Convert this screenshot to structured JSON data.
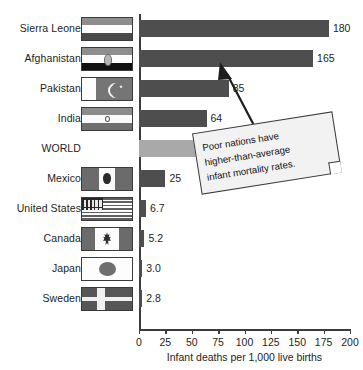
{
  "chart_data": {
    "type": "bar",
    "orientation": "horizontal",
    "title": "",
    "xlabel": "Infant deaths per 1,000 live births",
    "ylabel": "",
    "xlim": [
      0,
      200
    ],
    "xticks": [
      0,
      25,
      50,
      75,
      100,
      125,
      150,
      175,
      200
    ],
    "xtick_labels": [
      "0",
      "25",
      "50",
      "75",
      "100",
      "125",
      "150",
      "175",
      "200"
    ],
    "grid": false,
    "legend": "none",
    "categories": [
      "Sierra Leone",
      "Afghanistan",
      "Pakistan",
      "India",
      "WORLD",
      "Mexico",
      "United States",
      "Canada",
      "Japan",
      "Sweden"
    ],
    "values": [
      180,
      165,
      85,
      64,
      56,
      25,
      6.7,
      5.2,
      3.0,
      2.8
    ],
    "value_labels": [
      "180",
      "165",
      "85",
      "64",
      "56",
      "25",
      "6.7",
      "5.2",
      "3.0",
      "2.8"
    ],
    "bar_colors": [
      "#4e4e4e",
      "#4e4e4e",
      "#4e4e4e",
      "#4e4e4e",
      "#a9a9a9",
      "#4e4e4e",
      "#4e4e4e",
      "#4e4e4e",
      "#4e4e4e",
      "#4e4e4e"
    ],
    "annotations": [
      {
        "text": "Poor nations have higher-than-average infant mortality rates.",
        "points_to": "Afghanistan",
        "style": "callout-box-with-arrow"
      }
    ]
  },
  "rows": [
    {
      "label": "Sierra Leone",
      "value_label": "180",
      "flag": "sierra-leone-flag",
      "has_flag": true
    },
    {
      "label": "Afghanistan",
      "value_label": "165",
      "flag": "afghanistan-flag",
      "has_flag": true
    },
    {
      "label": "Pakistan",
      "value_label": "85",
      "flag": "pakistan-flag",
      "has_flag": true
    },
    {
      "label": "India",
      "value_label": "64",
      "flag": "india-flag",
      "has_flag": true
    },
    {
      "label": "WORLD",
      "value_label": "56",
      "flag": "",
      "has_flag": false
    },
    {
      "label": "Mexico",
      "value_label": "25",
      "flag": "mexico-flag",
      "has_flag": true
    },
    {
      "label": "United States",
      "value_label": "6.7",
      "flag": "united-states-flag",
      "has_flag": true
    },
    {
      "label": "Canada",
      "value_label": "5.2",
      "flag": "canada-flag",
      "has_flag": true
    },
    {
      "label": "Japan",
      "value_label": "3.0",
      "flag": "japan-flag",
      "has_flag": true
    },
    {
      "label": "Sweden",
      "value_label": "2.8",
      "flag": "sweden-flag",
      "has_flag": true
    }
  ],
  "axis": {
    "label": "Infant deaths per 1,000 live births",
    "ticks": [
      "0",
      "25",
      "50",
      "75",
      "100",
      "125",
      "150",
      "175",
      "200"
    ]
  },
  "callout": {
    "text": "Poor nations have\nhigher-than-average\ninfant mortality rates."
  },
  "colors": {
    "bar": "#4e4e4e",
    "bar_world": "#a9a9a9",
    "axis": "#3c3c3c",
    "text": "#1d1d1d",
    "callout_bg": "#f2f2f2",
    "background": "#ffffff"
  }
}
